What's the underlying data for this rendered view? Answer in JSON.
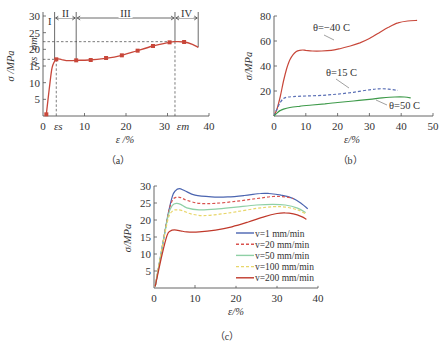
{
  "chart_data": [
    {
      "id": "a",
      "type": "line",
      "caption": "（a）",
      "title": "",
      "xlabel": "ε /%",
      "ylabel": "σ /MPa",
      "xlim": [
        0,
        40
      ],
      "ylim": [
        0,
        30
      ],
      "xticks": [
        0,
        10,
        20,
        30,
        40
      ],
      "yticks": [
        5,
        10,
        15,
        20,
        25,
        30
      ],
      "ytick_labels": [
        "5",
        "10",
        "15",
        "20",
        "25",
        "30"
      ],
      "grid": false,
      "annotations": {
        "sigma_m": {
          "label": "σm",
          "value": 22.3
        },
        "sigma_s": {
          "label": "σs",
          "value": 17.0
        },
        "epsilon_s": {
          "label": "εs",
          "value": 3.2
        },
        "epsilon_m": {
          "label": "εm",
          "value": 31.8
        },
        "regions": [
          {
            "label": "I",
            "from": 0,
            "to": 2.8
          },
          {
            "label": "II",
            "from": 2.8,
            "to": 8.0
          },
          {
            "label": "III",
            "from": 8.0,
            "to": 31.8
          },
          {
            "label": "IV",
            "from": 31.8,
            "to": 37.4
          }
        ]
      },
      "series": [
        {
          "name": "stress-strain",
          "color": "#c8473a",
          "marker": "square",
          "x": [
            0.8,
            1.5,
            2.2,
            3.2,
            4.5,
            6.0,
            8.0,
            11.0,
            15.0,
            19.0,
            22.5,
            26.5,
            30.5,
            31.8,
            34.0,
            36.0,
            37.4
          ],
          "y": [
            0.5,
            8.0,
            14.5,
            17.0,
            16.9,
            16.6,
            16.7,
            16.8,
            17.3,
            18.2,
            19.5,
            21.0,
            22.1,
            22.3,
            22.2,
            21.5,
            20.6
          ],
          "marker_x": [
            0.8,
            3.2,
            8.0,
            11.5,
            15.2,
            19.0,
            22.8,
            26.5,
            30.5,
            34.0
          ],
          "marker_y": [
            0.5,
            17.0,
            16.7,
            16.8,
            17.4,
            18.2,
            19.6,
            21.0,
            22.1,
            22.2
          ]
        }
      ]
    },
    {
      "id": "b",
      "type": "line",
      "caption": "（b）",
      "title": "",
      "xlabel": "ε/%",
      "ylabel": "σ/MPa",
      "xlim": [
        0,
        50
      ],
      "ylim": [
        0,
        80
      ],
      "xticks": [
        0,
        10,
        20,
        30,
        40,
        50
      ],
      "yticks": [
        20,
        40,
        60,
        80
      ],
      "grid": false,
      "series": [
        {
          "name": "θ=−40 C",
          "label": "θ=−40 C",
          "color": "#c8473a",
          "dash": false,
          "x": [
            0,
            1,
            2,
            3,
            4,
            5,
            6,
            7,
            8,
            9,
            10,
            12,
            15,
            18,
            21,
            24,
            27,
            30,
            33,
            36,
            39,
            42,
            45
          ],
          "y": [
            0,
            6,
            16,
            28,
            38,
            45,
            49,
            51.5,
            52.5,
            52.8,
            52.5,
            52.0,
            52.0,
            52.5,
            54.0,
            56.0,
            58.5,
            62.0,
            66.5,
            71.0,
            74.5,
            76.0,
            76.5
          ]
        },
        {
          "name": "θ=15 C",
          "label": "θ=15 C",
          "color": "#5a6fb5",
          "dash": true,
          "x": [
            0,
            1,
            2,
            3,
            4,
            6,
            10,
            15,
            20,
            25,
            30,
            33,
            36,
            39
          ],
          "y": [
            0,
            6,
            11,
            14,
            15,
            15.5,
            16,
            16.5,
            17.5,
            19,
            21,
            21.8,
            21.5,
            20.5
          ]
        },
        {
          "name": "θ=50 C",
          "label": "θ=50 C",
          "color": "#3e9a4a",
          "dash": false,
          "x": [
            0,
            1,
            2,
            3,
            5,
            8,
            12,
            16,
            20,
            25,
            30,
            34,
            38,
            41,
            43
          ],
          "y": [
            0,
            2.5,
            4.5,
            5.5,
            6.8,
            7.8,
            8.8,
            9.8,
            10.8,
            12.0,
            13.3,
            14.5,
            15.2,
            15.2,
            14.5
          ]
        }
      ]
    },
    {
      "id": "c",
      "type": "line",
      "caption": "（c）",
      "title": "",
      "xlabel": "ε/%",
      "ylabel": "σ/MPa",
      "xlim": [
        0,
        40
      ],
      "ylim": [
        0,
        30
      ],
      "xticks": [
        0,
        10,
        20,
        30,
        40
      ],
      "yticks": [
        5,
        10,
        15,
        20,
        25,
        30
      ],
      "grid": false,
      "legend_position": "lower-right",
      "series": [
        {
          "name": "v=1 mm/min",
          "label": "v=1 mm/min",
          "color": "#4a64b0",
          "dash": false,
          "x": [
            0.3,
            2,
            3.5,
            4.5,
            5.2,
            6.2,
            7.5,
            10,
            14,
            18,
            22,
            26,
            28,
            31,
            34,
            36,
            37.5
          ],
          "y": [
            0.5,
            12,
            22,
            27,
            28.6,
            29.2,
            28.6,
            27.3,
            26.8,
            26.8,
            27.2,
            27.8,
            27.8,
            27.3,
            26.3,
            24.8,
            23.3
          ]
        },
        {
          "name": "v=20 mm/min",
          "label": "v=20 mm/min",
          "color": "#d9534f",
          "dash": true,
          "x": [
            0.3,
            2,
            3.5,
            4.5,
            5.5,
            6.5,
            8,
            11,
            15,
            20,
            25,
            29,
            32,
            34
          ],
          "y": [
            0.5,
            12,
            22,
            25.8,
            26.7,
            26.6,
            25.8,
            24.9,
            24.9,
            25.5,
            26.3,
            26.9,
            26.8,
            26.3
          ]
        },
        {
          "name": "v=50 mm/min",
          "label": "v=50 mm/min",
          "color": "#8fd0a6",
          "dash": false,
          "x": [
            0.3,
            2,
            3.5,
            4.5,
            5.5,
            6.5,
            8,
            11,
            15,
            20,
            25,
            29,
            32,
            35,
            37
          ],
          "y": [
            0.5,
            12,
            21.5,
            24.3,
            24.9,
            24.6,
            23.6,
            23.0,
            23.2,
            23.8,
            24.4,
            24.6,
            24.4,
            23.5,
            22.2
          ]
        },
        {
          "name": "v=100 mm/min",
          "label": "v=100 mm/min",
          "color": "#e8d66a",
          "dash": true,
          "x": [
            0.3,
            2,
            3.5,
            4.5,
            5.5,
            7,
            9,
            12,
            16,
            20,
            25,
            29,
            32,
            35,
            37
          ],
          "y": [
            0.5,
            12,
            20.5,
            22.6,
            23.0,
            22.7,
            21.8,
            21.3,
            21.7,
            22.4,
            23.4,
            23.9,
            23.8,
            23.0,
            21.8
          ]
        },
        {
          "name": "v=200 mm/min",
          "label": "v=200 mm/min",
          "color": "#c0392b",
          "dash": false,
          "x": [
            0.3,
            2,
            3.2,
            4.0,
            5.0,
            6.5,
            8,
            11,
            15,
            19,
            23,
            27,
            30,
            32,
            34,
            36,
            37.2
          ],
          "y": [
            0.5,
            10,
            15.5,
            16.8,
            17.1,
            16.8,
            16.5,
            16.5,
            17.0,
            18.0,
            19.4,
            21.0,
            21.9,
            22.1,
            21.8,
            21.0,
            20.2
          ]
        }
      ]
    }
  ]
}
